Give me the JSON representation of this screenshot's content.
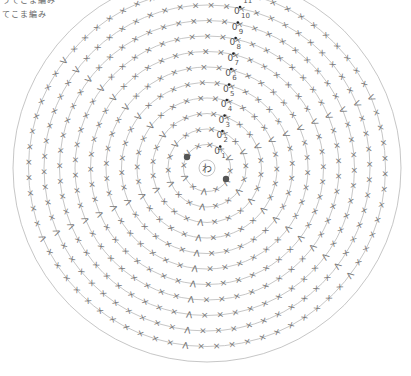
{
  "legend": {
    "line1": "うてこま編み",
    "line2": "てこま編み"
  },
  "diagram": {
    "type": "crochet-round-chart",
    "center_label": "わ",
    "center": [
      207,
      168
    ],
    "ring_spacing": 15.5,
    "center_radius": 8,
    "rounds": 11,
    "round_labels": [
      "1",
      "2",
      "3",
      "4",
      "5",
      "6",
      "7",
      "8",
      "9",
      "10",
      "11"
    ],
    "chain_symbol": "0",
    "stitch_symbols": {
      "sc": "×",
      "inc": "V",
      "sl_st": "●"
    },
    "start_markers": [
      [
        187,
        157
      ],
      [
        226,
        179
      ]
    ],
    "colors": {
      "line": "#b8b8b8",
      "stitch": "#777777",
      "marker": "#555555",
      "text": "#555555"
    }
  }
}
